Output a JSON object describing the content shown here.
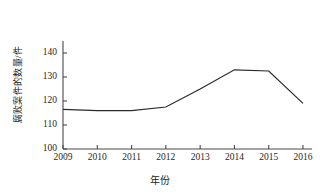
{
  "chart_data": {
    "type": "line",
    "title": "",
    "xlabel": "年份",
    "ylabel": "腐败案件的数量/件",
    "categories": [
      "2009",
      "2010",
      "2011",
      "2012",
      "2013",
      "2014",
      "2015",
      "2016"
    ],
    "values": [
      116.5,
      116,
      116,
      117.5,
      125,
      133,
      132.5,
      119
    ],
    "series": [
      {
        "name": "腐败案件的数量",
        "values": [
          116.5,
          116,
          116,
          117.5,
          125,
          133,
          132.5,
          119
        ]
      }
    ],
    "ylim": [
      100,
      145
    ],
    "xlim": [
      "2009",
      "2016"
    ],
    "ytick_labels": [
      "100",
      "110",
      "120",
      "130",
      "140"
    ],
    "ytick_values": [
      100,
      110,
      120,
      130,
      140
    ],
    "xtick_labels": [
      "2009",
      "2010",
      "2011",
      "2012",
      "2013",
      "2014",
      "2015",
      "2016"
    ],
    "grid": false,
    "legend": false,
    "legend_position": "none",
    "line_color": "#2b2b2b",
    "axis_color": "#4a4a4a",
    "background_color": "#ffffff"
  }
}
